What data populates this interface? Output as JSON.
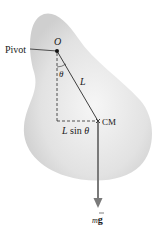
{
  "diagram": {
    "labels": {
      "pivot": "Pivot",
      "origin": "O",
      "angle": "θ",
      "length": "L",
      "lever_arm": "L sin θ",
      "center_of_mass": "CM",
      "weight": "mg"
    },
    "colors": {
      "body_fill": "#d9d9d9",
      "body_edge": "#f4f4f4",
      "line": "#2a2a2a",
      "arrow": "#7a7a7a"
    }
  }
}
